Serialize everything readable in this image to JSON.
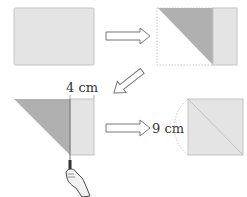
{
  "diagram": {
    "steps": [
      {
        "id": "rectangle",
        "description": "Rectangular sheet of paper"
      },
      {
        "id": "folded",
        "description": "Corner folded over diagonally leaving a strip"
      },
      {
        "id": "cut",
        "description": "Strip cut off with scissors"
      },
      {
        "id": "square",
        "description": "Unfolded square with diagonal crease"
      }
    ],
    "labels": {
      "strip_width": "4 cm",
      "square_side": "9 cm"
    },
    "colors": {
      "paper": "#e4e4e4",
      "paper_border": "#c4c4c4",
      "folded": "#b0b0b0",
      "arrow_stroke": "#777777"
    }
  }
}
